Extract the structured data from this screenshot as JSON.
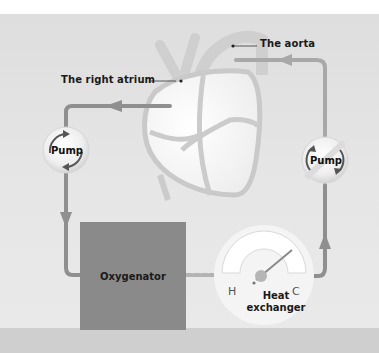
{
  "diagram": {
    "labels": {
      "right_atrium": "The right atrium",
      "aorta": "The aorta"
    },
    "components": {
      "pump_left": "Pump",
      "pump_right": "Pump",
      "oxygenator": "Oxygenator",
      "heat_exchanger_line1": "Heat",
      "heat_exchanger_line2": "exchanger",
      "gauge_hot": "H",
      "gauge_cold": "C"
    },
    "flow": [
      "The right atrium",
      "Pump",
      "Oxygenator",
      "Heat exchanger",
      "Pump",
      "The aorta"
    ],
    "colors": {
      "background": "#e4e4e4",
      "tube": "#8f8f8f",
      "oxygenator": "#8a8a8a",
      "heart_outline": "#c8c8c8",
      "heart_fill": "#f7f7f7",
      "label_text": "#1a1a1a"
    }
  }
}
